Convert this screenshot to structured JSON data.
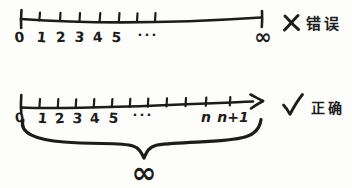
{
  "figure": {
    "description_colors": {
      "ink": "#1c1c1b",
      "paper": "#fdfdfb"
    },
    "top": {
      "labels": [
        "0",
        "1",
        "2",
        "3",
        "4",
        "5"
      ],
      "ellipsis": "···",
      "end_symbol": "∞",
      "verdict": {
        "icon": "x-mark",
        "text": "错误"
      }
    },
    "bottom": {
      "labels": [
        "0",
        "1",
        "2",
        "3",
        "4",
        "5"
      ],
      "ellipsis": "···",
      "n_label": "n",
      "n_plus_one_label": "n+1",
      "verdict": {
        "icon": "check-mark",
        "text": "正确"
      },
      "brace_symbol": "∞"
    }
  }
}
